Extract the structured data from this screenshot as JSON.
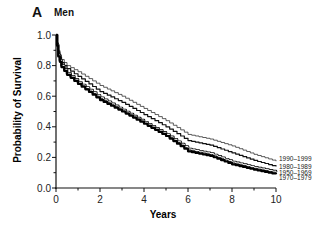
{
  "panel": {
    "letter": "A",
    "title": "Men"
  },
  "chart_data": {
    "type": "line",
    "title": "Men",
    "panel_label": "A",
    "xlabel": "Years",
    "ylabel": "Probability of Survival",
    "xlim": [
      0,
      10
    ],
    "ylim": [
      0,
      1.0
    ],
    "xticks": [
      0,
      2,
      4,
      6,
      8,
      10
    ],
    "xtick_labels": [
      "0",
      "2",
      "4",
      "6",
      "8",
      "10"
    ],
    "yticks": [
      0.0,
      0.2,
      0.4,
      0.6,
      0.8,
      1.0
    ],
    "ytick_labels": [
      "0.0",
      "0.2",
      "0.4",
      "0.6",
      "0.8",
      "1.0"
    ],
    "grid": false,
    "legend_position": "right-end labels",
    "x": [
      0,
      0.1,
      0.25,
      0.5,
      1,
      2,
      3,
      4,
      5,
      6,
      7,
      8,
      9,
      10
    ],
    "series": [
      {
        "name": "1990–1999",
        "style": "thin",
        "values": [
          1.0,
          0.9,
          0.84,
          0.8,
          0.76,
          0.67,
          0.6,
          0.52,
          0.44,
          0.35,
          0.32,
          0.275,
          0.22,
          0.175
        ]
      },
      {
        "name": "1980–1989",
        "style": "medium",
        "values": [
          1.0,
          0.89,
          0.82,
          0.78,
          0.73,
          0.63,
          0.56,
          0.48,
          0.4,
          0.31,
          0.28,
          0.23,
          0.18,
          0.14
        ]
      },
      {
        "name": "1950–1969",
        "style": "double",
        "values": [
          1.0,
          0.87,
          0.8,
          0.75,
          0.69,
          0.59,
          0.51,
          0.43,
          0.35,
          0.255,
          0.225,
          0.17,
          0.135,
          0.105
        ]
      },
      {
        "name": "1970–1979",
        "style": "thick",
        "values": [
          1.0,
          0.86,
          0.79,
          0.74,
          0.68,
          0.575,
          0.5,
          0.42,
          0.34,
          0.24,
          0.21,
          0.155,
          0.12,
          0.09
        ]
      }
    ]
  }
}
